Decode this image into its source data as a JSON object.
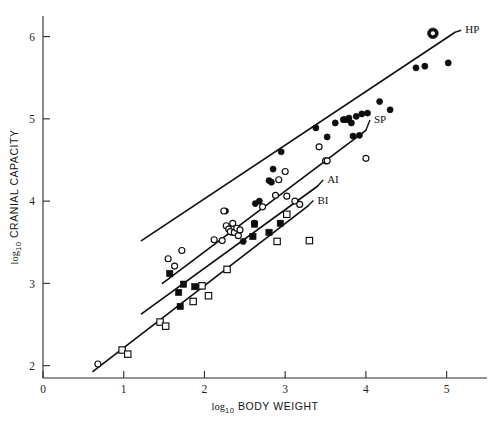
{
  "chart_data": {
    "type": "scatter",
    "title": "",
    "xlabel": "log10 BODY WEIGHT",
    "ylabel": "log10 CRANIAL CAPACITY",
    "xlabel_parts": {
      "lead": "log",
      "sub": "10",
      "rest": " BODY WEIGHT"
    },
    "ylabel_parts": {
      "lead": "log",
      "sub": "10",
      "rest": " CRANIAL CAPACITY"
    },
    "xlim": [
      0,
      5.5
    ],
    "ylim": [
      1.85,
      6.25
    ],
    "xticks": [
      0,
      1,
      2,
      3,
      4,
      5
    ],
    "yticks": [
      2,
      3,
      4,
      5,
      6
    ],
    "xticklabels": [
      "0",
      "1",
      "2",
      "3",
      "4",
      "5"
    ],
    "yticklabels": [
      "2",
      "3",
      "4",
      "5",
      "6"
    ],
    "grid": false,
    "legend_position": "inline-line-labels",
    "series": [
      {
        "name": "HP",
        "label": "HP",
        "marker": "filled-circle",
        "label_xy": [
          5.23,
          6.04
        ],
        "points": [
          [
            2.26,
            3.88
          ],
          [
            2.34,
            3.62
          ],
          [
            2.48,
            3.51
          ],
          [
            2.63,
            3.97
          ],
          [
            2.68,
            4.0
          ],
          [
            2.8,
            4.25
          ],
          [
            2.83,
            4.23
          ],
          [
            2.85,
            4.39
          ],
          [
            2.95,
            4.6
          ],
          [
            3.38,
            4.89
          ],
          [
            3.52,
            4.78
          ],
          [
            3.62,
            4.95
          ],
          [
            3.72,
            4.99
          ],
          [
            3.74,
            4.99
          ],
          [
            3.78,
            4.99
          ],
          [
            3.79,
            5.01
          ],
          [
            3.82,
            4.95
          ],
          [
            3.84,
            4.79
          ],
          [
            3.88,
            5.03
          ],
          [
            3.92,
            4.8
          ],
          [
            3.95,
            5.06
          ],
          [
            4.02,
            5.07
          ],
          [
            4.17,
            5.21
          ],
          [
            4.3,
            5.11
          ],
          [
            4.62,
            5.62
          ],
          [
            4.73,
            5.64
          ],
          [
            5.02,
            5.68
          ]
        ]
      },
      {
        "name": "SP",
        "label": "SP",
        "marker": "open-circle",
        "label_xy": [
          4.1,
          4.95
        ],
        "points": [
          [
            0.68,
            2.02
          ],
          [
            1.55,
            3.3
          ],
          [
            1.63,
            3.21
          ],
          [
            1.72,
            3.4
          ],
          [
            1.96,
            2.97
          ],
          [
            2.12,
            3.53
          ],
          [
            2.22,
            3.52
          ],
          [
            2.24,
            3.88
          ],
          [
            2.27,
            3.7
          ],
          [
            2.3,
            3.66
          ],
          [
            2.32,
            3.63
          ],
          [
            2.35,
            3.73
          ],
          [
            2.37,
            3.62
          ],
          [
            2.4,
            3.67
          ],
          [
            2.42,
            3.58
          ],
          [
            2.44,
            3.65
          ],
          [
            2.62,
            3.73
          ],
          [
            2.72,
            3.93
          ],
          [
            2.88,
            4.07
          ],
          [
            2.92,
            4.26
          ],
          [
            3.0,
            4.36
          ],
          [
            3.02,
            4.06
          ],
          [
            3.12,
            4.0
          ],
          [
            3.18,
            3.96
          ],
          [
            3.42,
            4.66
          ],
          [
            3.5,
            4.49
          ],
          [
            3.52,
            4.49
          ],
          [
            4.0,
            4.52
          ]
        ]
      },
      {
        "name": "AI",
        "label": "AI",
        "marker": "filled-square",
        "label_xy": [
          3.52,
          4.22
        ],
        "points": [
          [
            1.57,
            3.12
          ],
          [
            1.68,
            2.89
          ],
          [
            1.7,
            2.72
          ],
          [
            1.74,
            2.99
          ],
          [
            1.88,
            2.96
          ],
          [
            2.6,
            3.57
          ],
          [
            2.62,
            3.72
          ],
          [
            2.8,
            3.62
          ],
          [
            2.94,
            3.73
          ]
        ]
      },
      {
        "name": "BI",
        "label": "BI",
        "marker": "open-square",
        "label_xy": [
          3.4,
          3.97
        ],
        "points": [
          [
            0.98,
            2.19
          ],
          [
            1.05,
            2.14
          ],
          [
            1.45,
            2.53
          ],
          [
            1.52,
            2.48
          ],
          [
            1.86,
            2.78
          ],
          [
            1.97,
            2.97
          ],
          [
            2.05,
            2.85
          ],
          [
            2.28,
            3.17
          ],
          [
            2.9,
            3.51
          ],
          [
            3.02,
            3.84
          ],
          [
            3.3,
            3.52
          ]
        ]
      },
      {
        "name": "highlight",
        "label": "",
        "marker": "circle-with-white-center",
        "points": [
          [
            4.83,
            6.04
          ]
        ]
      }
    ],
    "fit_lines": [
      {
        "name": "HP",
        "label": "HP",
        "x0": 1.22,
        "y0": 3.52,
        "x1": 5.1,
        "y1": 6.05
      },
      {
        "name": "SP",
        "label": "SP",
        "x0": 1.48,
        "y0": 3.0,
        "x1": 4.0,
        "y1": 4.86
      },
      {
        "name": "AI",
        "label": "AI",
        "x0": 1.22,
        "y0": 2.63,
        "x1": 3.4,
        "y1": 4.18
      },
      {
        "name": "BI",
        "label": "BI",
        "x0": 0.62,
        "y0": 1.93,
        "x1": 3.28,
        "y1": 3.94
      }
    ],
    "marker_legend": [
      {
        "key": "filled-circle",
        "series": "HP"
      },
      {
        "key": "open-circle",
        "series": "SP"
      },
      {
        "key": "filled-square",
        "series": "AI"
      },
      {
        "key": "open-square",
        "series": "BI"
      }
    ],
    "colors": {
      "ink": "#0d0d0d",
      "axis": "#2b2b2b",
      "background": "#ffffff"
    }
  }
}
